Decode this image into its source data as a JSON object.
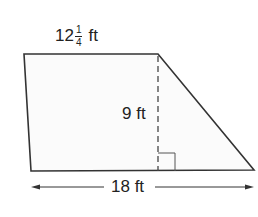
{
  "figure": {
    "type": "trapezoid",
    "fill_color": "#fbfbfb",
    "stroke_color": "#333333",
    "vertices": {
      "top_left": [
        24,
        54
      ],
      "top_right": [
        158,
        54
      ],
      "bottom_right": [
        254,
        170
      ],
      "bottom_left": [
        31,
        171
      ]
    }
  },
  "labels": {
    "top_base": {
      "whole": "12",
      "numerator": "1",
      "denominator": "4",
      "unit": "ft"
    },
    "height": "9 ft",
    "bottom_base": "18 ft"
  },
  "annotations": {
    "height_line_style": "dashed",
    "right_angle_marker": true,
    "bottom_dimension_arrows": "double-headed"
  }
}
